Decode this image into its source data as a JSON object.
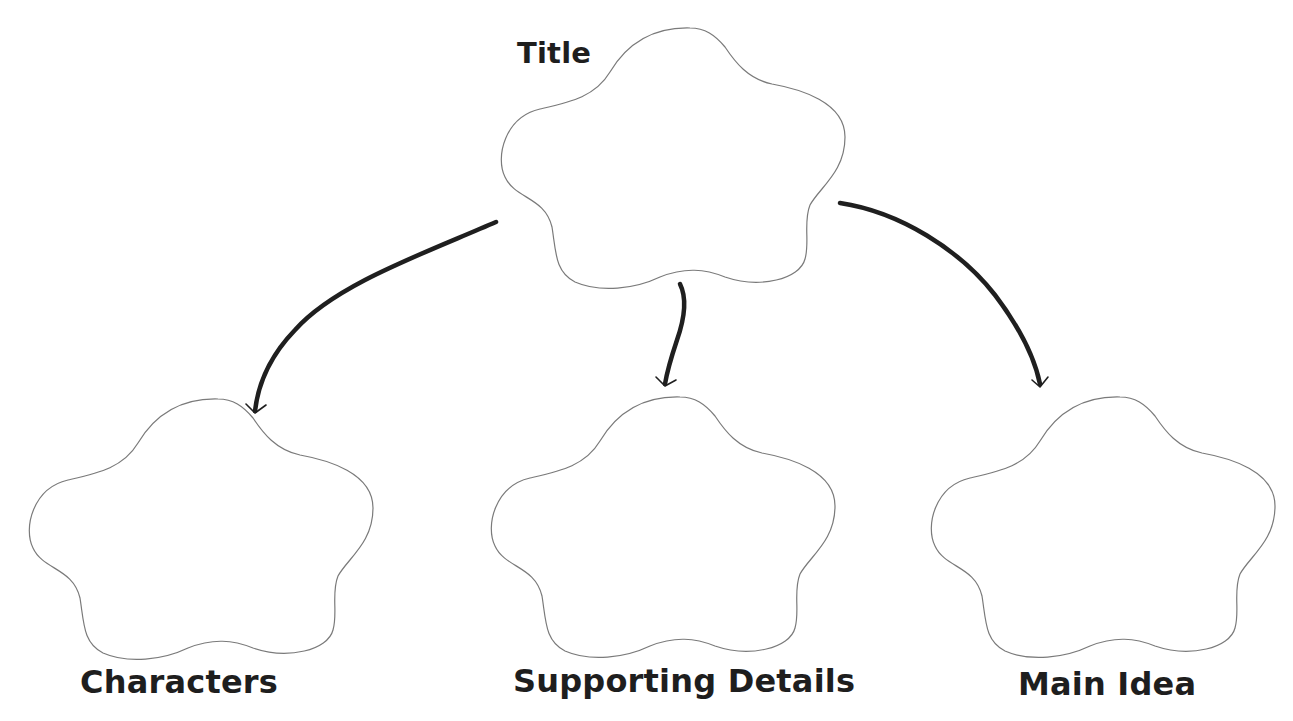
{
  "diagram": {
    "type": "graphic-organizer",
    "root": {
      "label": "Title",
      "shape": "cloud-icon"
    },
    "children": [
      {
        "label": "Characters",
        "shape": "cloud-icon"
      },
      {
        "label": "Supporting Details",
        "shape": "cloud-icon"
      },
      {
        "label": "Main Idea",
        "shape": "cloud-icon"
      }
    ],
    "edges": [
      {
        "from": "Title",
        "to": "Characters"
      },
      {
        "from": "Title",
        "to": "Supporting Details"
      },
      {
        "from": "Title",
        "to": "Main Idea"
      }
    ],
    "colors": {
      "background": "#ffffff",
      "cloud_stroke": "#7a7a7a",
      "arrow": "#1f1f1f",
      "text": "#1e1e1e"
    }
  }
}
